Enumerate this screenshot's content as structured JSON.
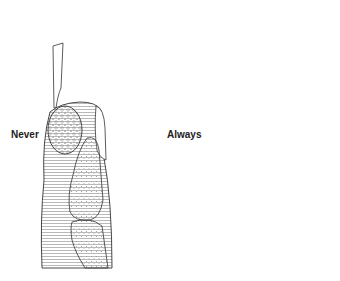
{
  "figure": {
    "labels": {
      "left": "Never",
      "right": "Always"
    },
    "panels": [
      {
        "id": "left",
        "tool": "scalpel-blade",
        "label": "Never",
        "lesion": "stippled-oval"
      },
      {
        "id": "right",
        "tool": "curved-scissors",
        "label": "Always",
        "lesion": "excised-crater"
      }
    ],
    "colors": {
      "line": "#333333",
      "hatch": "#777777",
      "background": "#ffffff"
    }
  }
}
